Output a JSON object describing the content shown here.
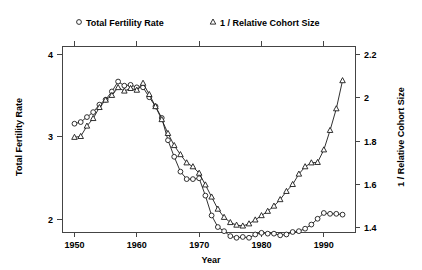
{
  "chart_data": {
    "type": "line",
    "title": "",
    "xlabel": "Year",
    "ylabel": "Total Fertility Rate",
    "y2label": "1 / Relative Cohort Size",
    "xlim": [
      1948,
      1995
    ],
    "ylim": [
      1.85,
      4.1
    ],
    "y2lim": [
      1.38,
      2.24
    ],
    "grid": false,
    "legend_position": "top",
    "xticks": [
      1950,
      1960,
      1970,
      1980,
      1990
    ],
    "xtick_labels": [
      "1950",
      "1960",
      "1970",
      "1980",
      "1990"
    ],
    "yticks": [
      2,
      3,
      4
    ],
    "ytick_labels": [
      "2",
      "3",
      "4"
    ],
    "y2ticks": [
      1.4,
      1.6,
      1.8,
      2.0,
      2.2
    ],
    "y2tick_labels": [
      "1.4",
      "1.6",
      "1.8",
      "2",
      "2.2"
    ],
    "series": [
      {
        "name": "Total Fertility Rate",
        "marker": "circle",
        "axis": "left",
        "x": [
          1950,
          1951,
          1952,
          1953,
          1954,
          1955,
          1956,
          1957,
          1958,
          1959,
          1960,
          1961,
          1962,
          1963,
          1964,
          1965,
          1966,
          1967,
          1968,
          1969,
          1970,
          1971,
          1972,
          1973,
          1974,
          1975,
          1976,
          1977,
          1978,
          1979,
          1980,
          1981,
          1982,
          1983,
          1984,
          1985,
          1986,
          1987,
          1988,
          1989,
          1990,
          1991,
          1992,
          1993
        ],
        "values": [
          3.16,
          3.18,
          3.24,
          3.3,
          3.39,
          3.45,
          3.55,
          3.67,
          3.62,
          3.63,
          3.6,
          3.6,
          3.48,
          3.37,
          3.23,
          2.96,
          2.76,
          2.58,
          2.49,
          2.49,
          2.5,
          2.29,
          2.05,
          1.91,
          1.86,
          1.8,
          1.78,
          1.79,
          1.78,
          1.82,
          1.84,
          1.83,
          1.83,
          1.81,
          1.82,
          1.85,
          1.86,
          1.89,
          1.94,
          2.01,
          2.08,
          2.07,
          2.07,
          2.06
        ]
      },
      {
        "name": "1 / Relative Cohort Size",
        "marker": "triangle",
        "axis": "right",
        "x": [
          1950,
          1951,
          1952,
          1953,
          1954,
          1955,
          1956,
          1957,
          1958,
          1959,
          1960,
          1961,
          1962,
          1963,
          1964,
          1965,
          1966,
          1967,
          1968,
          1969,
          1970,
          1971,
          1972,
          1973,
          1974,
          1975,
          1976,
          1977,
          1978,
          1979,
          1980,
          1981,
          1982,
          1983,
          1984,
          1985,
          1986,
          1987,
          1988,
          1989,
          1990,
          1991,
          1992,
          1993
        ],
        "values": [
          1.818,
          1.822,
          1.87,
          1.905,
          1.956,
          1.99,
          2.012,
          2.048,
          2.032,
          2.044,
          2.036,
          2.068,
          2.016,
          1.96,
          1.9,
          1.836,
          1.78,
          1.738,
          1.7,
          1.682,
          1.652,
          1.598,
          1.542,
          1.486,
          1.448,
          1.424,
          1.412,
          1.408,
          1.418,
          1.436,
          1.456,
          1.476,
          1.5,
          1.53,
          1.568,
          1.6,
          1.648,
          1.682,
          1.7,
          1.702,
          1.76,
          1.85,
          1.95,
          2.08
        ]
      }
    ],
    "legend": [
      {
        "marker": "circle",
        "label": "Total Fertility Rate"
      },
      {
        "marker": "triangle",
        "label": "1 / Relative Cohort Size"
      }
    ]
  }
}
